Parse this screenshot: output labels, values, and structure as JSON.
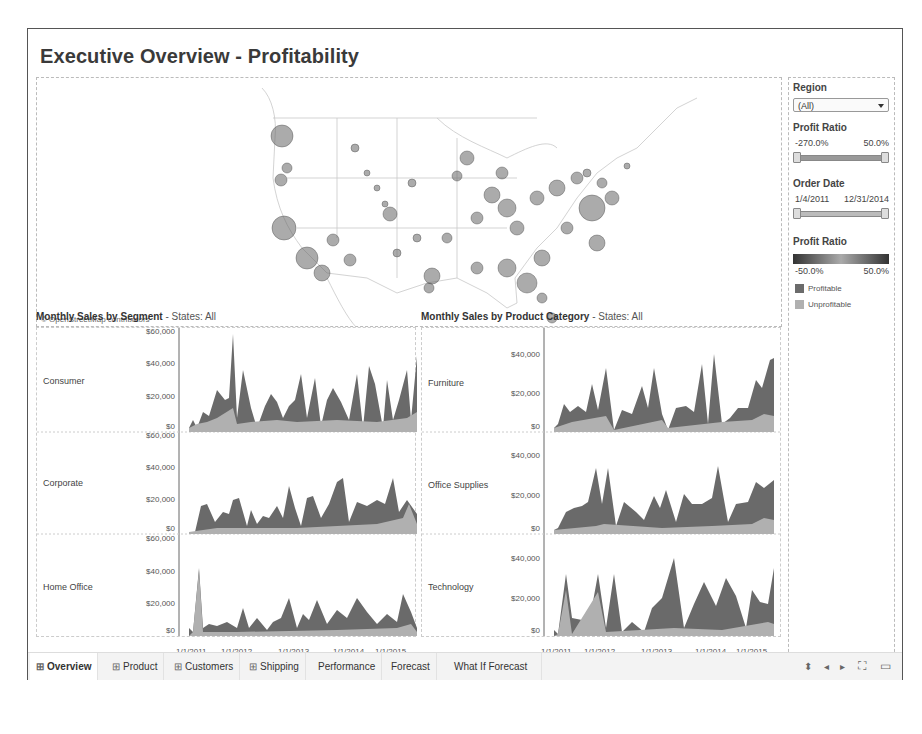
{
  "dashboard": {
    "title": "Executive Overview - Profitability",
    "map_attribution": "© OpenStreetMap contributors"
  },
  "filters": {
    "region": {
      "label": "Region",
      "value": "(All)"
    },
    "profit_ratio": {
      "label": "Profit Ratio",
      "min": "-270.0%",
      "max": "50.0%"
    },
    "order_date": {
      "label": "Order Date",
      "min": "1/4/2011",
      "max": "12/31/2014"
    },
    "color_legend": {
      "label": "Profit Ratio",
      "min": "-50.0%",
      "max": "50.0%"
    },
    "legend": [
      {
        "label": "Profitable",
        "color": "#6b6b6b"
      },
      {
        "label": "Unprofitable",
        "color": "#b0b0b0"
      }
    ]
  },
  "segment_chart": {
    "title_bold": "Monthly Sales by Segment",
    "title_rest": " - States: All",
    "rows": [
      {
        "label": "Consumer",
        "ticks": [
          "$60,000",
          "$40,000",
          "$20,000",
          "$0"
        ]
      },
      {
        "label": "Corporate",
        "ticks": [
          "$60,000",
          "$40,000",
          "$20,000",
          "$0"
        ]
      },
      {
        "label": "Home Office",
        "ticks": [
          "$60,000",
          "$40,000",
          "$20,000",
          "$0"
        ]
      }
    ],
    "x_ticks": [
      "1/1/2011",
      "1/1/2012",
      "1/1/2013",
      "1/1/2014",
      "1/1/2015"
    ]
  },
  "category_chart": {
    "title_bold": "Monthly Sales by Product Category",
    "title_rest": " - States: All",
    "rows": [
      {
        "label": "Furniture",
        "ticks": [
          "$40,000",
          "$20,000",
          "$0"
        ]
      },
      {
        "label": "Office Supplies",
        "ticks": [
          "$40,000",
          "$20,000",
          "$0"
        ]
      },
      {
        "label": "Technology",
        "ticks": [
          "$40,000",
          "$20,000",
          "$0"
        ]
      }
    ],
    "x_ticks": [
      "1/1/2011",
      "1/1/2012",
      "1/1/2013",
      "1/1/2014",
      "1/1/2015"
    ]
  },
  "tabs": [
    {
      "label": "Overview",
      "icon": "grid-icon",
      "active": true
    },
    {
      "label": "Product",
      "icon": "grid-icon"
    },
    {
      "label": "Customers",
      "icon": "grid-icon"
    },
    {
      "label": "Shipping",
      "icon": "grid-icon"
    },
    {
      "label": "Performance"
    },
    {
      "label": "Forecast"
    },
    {
      "label": "What If Forecast"
    }
  ],
  "nav": {
    "sort": "⬍",
    "prev": "◂",
    "next": "▸",
    "fullscreen": "⛶",
    "present": "▭"
  }
}
